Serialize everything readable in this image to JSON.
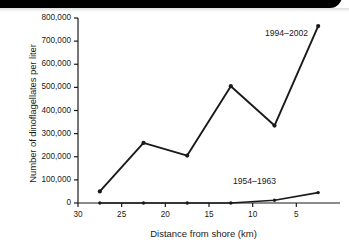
{
  "figure": {
    "banner_color": "#000000",
    "background": "#ffffff",
    "line_color": "#1a1a1a"
  },
  "chart_data": {
    "type": "line",
    "title": "",
    "xlabel": "Distance from shore (km)",
    "ylabel": "Number of dinoflagellates per liter",
    "xlim": [
      30,
      0
    ],
    "ylim": [
      0,
      800000
    ],
    "x_reversed": true,
    "grid": false,
    "legend_position": "inline-annotation",
    "xticks": [
      30,
      25,
      20,
      15,
      10,
      5
    ],
    "xtick_labels": [
      "30",
      "25",
      "20",
      "15",
      "10",
      "5"
    ],
    "yticks": [
      0,
      100000,
      200000,
      300000,
      400000,
      500000,
      600000,
      700000,
      800000
    ],
    "ytick_labels": [
      "0",
      "100,000",
      "200,000",
      "300,000",
      "400,000",
      "500,000",
      "600,000",
      "700,000",
      "800,000"
    ],
    "x": [
      27.5,
      22.5,
      17.5,
      12.5,
      7.5,
      2.5
    ],
    "series": [
      {
        "name": "1994–2002",
        "values": [
          50000,
          260000,
          205000,
          505000,
          335000,
          765000
        ],
        "marker": "dot",
        "label_position": {
          "x": 265,
          "y": 28
        }
      },
      {
        "name": "1954–1963",
        "values": [
          0,
          0,
          0,
          0,
          12000,
          45000
        ],
        "marker": "dot",
        "label_position": {
          "x": 233,
          "y": 176
        }
      }
    ]
  }
}
